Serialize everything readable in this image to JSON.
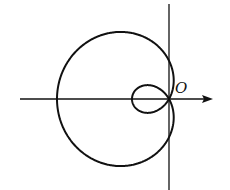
{
  "diagram": {
    "type": "polar-curve",
    "curve": "limacon with inner loop",
    "origin_label": "O",
    "colors": {
      "stroke": "#111111",
      "background": "#ffffff"
    },
    "origin_px": [
      169,
      99
    ],
    "outer_loop_left_extent_px": 112,
    "inner_loop_left_extent_px": 37,
    "x_axis": {
      "from_x": 20,
      "to_x": 213,
      "arrow": true
    },
    "y_axis": {
      "from_y": 4,
      "to_y": 190,
      "arrow": false
    }
  }
}
